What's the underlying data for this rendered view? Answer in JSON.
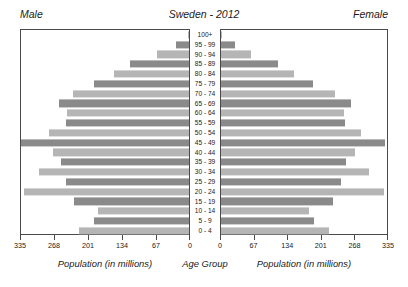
{
  "header": {
    "male_label": "Male",
    "title": "Sweden - 2012",
    "female_label": "Female"
  },
  "axis_titles": {
    "left": "Population (in millions)",
    "center": "Age Group",
    "right": "Population (in millions)"
  },
  "colors": {
    "bar_dark": "#8a8a8a",
    "bar_light": "#b5b5b5",
    "frame": "#4a4a4a",
    "text": "#1a1a1a",
    "background": "#ffffff"
  },
  "chart_data": {
    "type": "bar",
    "subtype": "population-pyramid",
    "title": "Sweden - 2012",
    "xlabel": "Population (in millions)",
    "ylabel": "Age Group",
    "grid": false,
    "legend": false,
    "left_series_name": "Male",
    "right_series_name": "Female",
    "xlim": [
      0,
      335
    ],
    "left_ticks": [
      335,
      268,
      201,
      134,
      67,
      0
    ],
    "right_ticks": [
      0,
      67,
      134,
      201,
      268,
      335
    ],
    "categories": [
      "100+",
      "95 - 99",
      "90 - 94",
      "85 - 89",
      "80 - 84",
      "75 - 79",
      "70 - 74",
      "65 - 69",
      "60 - 64",
      "55 - 59",
      "50 - 54",
      "45 - 49",
      "40 - 44",
      "35 - 39",
      "30 - 34",
      "25 - 29",
      "20 - 24",
      "15 - 19",
      "10 - 14",
      "5 - 9",
      "0 - 4"
    ],
    "series": [
      {
        "name": "Male",
        "values": [
          2,
          26,
          63,
          118,
          150,
          189,
          232,
          260,
          244,
          246,
          280,
          335,
          272,
          255,
          300,
          245,
          330,
          229,
          181,
          190,
          220
        ]
      },
      {
        "name": "Female",
        "values": [
          3,
          28,
          60,
          115,
          148,
          186,
          230,
          263,
          248,
          250,
          282,
          330,
          270,
          252,
          298,
          243,
          328,
          227,
          178,
          188,
          218
        ]
      }
    ]
  }
}
